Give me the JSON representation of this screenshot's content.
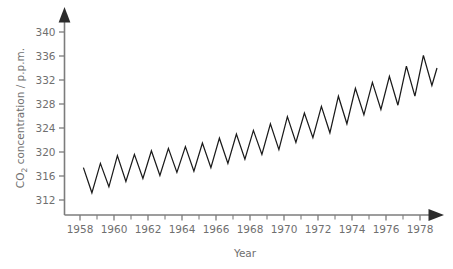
{
  "chart_data": {
    "type": "line",
    "title": "",
    "subtitle": "",
    "xlabel": "Year",
    "ylabel": "CO2 concentration / p.p.m.",
    "ylabel_parts": {
      "prefix": "CO",
      "subscript": "2",
      "suffix": " concentration / p.p.m."
    },
    "grid": false,
    "legend": "none",
    "xlim": [
      1957.6,
      1979.3
    ],
    "ylim": [
      310.0,
      341.5
    ],
    "x_ticks_major": [
      1958,
      1960,
      1962,
      1964,
      1966,
      1968,
      1970,
      1972,
      1974,
      1976,
      1978
    ],
    "x_tick_labels": [
      "1958",
      "1960",
      "1962",
      "1964",
      "1966",
      "1968",
      "1970",
      "1972",
      "1974",
      "1976",
      "1978"
    ],
    "x_ticks_minor": [
      1959,
      1961,
      1963,
      1965,
      1967,
      1969,
      1971,
      1973,
      1975,
      1977,
      1979
    ],
    "y_ticks": [
      312,
      316,
      320,
      324,
      328,
      332,
      336,
      340
    ],
    "y_tick_labels": [
      "312",
      "316",
      "320",
      "324",
      "328",
      "332",
      "336",
      "340"
    ],
    "series": [
      {
        "name": "Atmospheric CO2 (Mauna Loa monthly mean)",
        "color": "#1a1a1a",
        "x": [
          1958.2,
          1958.7,
          1959.2,
          1959.7,
          1960.2,
          1960.7,
          1961.2,
          1961.7,
          1962.2,
          1962.7,
          1963.2,
          1963.7,
          1964.2,
          1964.7,
          1965.2,
          1965.7,
          1966.2,
          1966.7,
          1967.2,
          1967.7,
          1968.2,
          1968.7,
          1969.2,
          1969.7,
          1970.2,
          1970.7,
          1971.2,
          1971.7,
          1972.2,
          1972.7,
          1973.2,
          1973.7,
          1974.2,
          1974.7,
          1975.2,
          1975.7,
          1976.2,
          1976.7,
          1977.2,
          1977.7,
          1978.2,
          1978.7,
          1979.0
        ],
        "values": [
          317.4,
          313.2,
          318.1,
          314.2,
          319.4,
          315.1,
          319.6,
          315.6,
          320.2,
          316.1,
          320.6,
          316.6,
          320.9,
          316.8,
          321.5,
          317.4,
          322.3,
          318.1,
          323.0,
          318.8,
          323.6,
          319.6,
          324.7,
          320.4,
          325.9,
          321.6,
          326.5,
          322.4,
          327.6,
          323.2,
          329.3,
          324.7,
          330.6,
          326.2,
          331.6,
          327.1,
          332.6,
          327.8,
          334.3,
          329.3,
          336.1,
          331.1,
          334.0
        ],
        "annual_peaks": [
          {
            "year": 1958,
            "value": 317.4
          },
          {
            "year": 1959,
            "value": 318.1
          },
          {
            "year": 1960,
            "value": 319.4
          },
          {
            "year": 1961,
            "value": 319.6
          },
          {
            "year": 1962,
            "value": 320.2
          },
          {
            "year": 1963,
            "value": 320.6
          },
          {
            "year": 1964,
            "value": 320.9
          },
          {
            "year": 1965,
            "value": 321.5
          },
          {
            "year": 1966,
            "value": 322.3
          },
          {
            "year": 1967,
            "value": 323.0
          },
          {
            "year": 1968,
            "value": 323.6
          },
          {
            "year": 1969,
            "value": 324.7
          },
          {
            "year": 1970,
            "value": 325.9
          },
          {
            "year": 1971,
            "value": 326.5
          },
          {
            "year": 1972,
            "value": 327.6
          },
          {
            "year": 1973,
            "value": 329.3
          },
          {
            "year": 1974,
            "value": 330.6
          },
          {
            "year": 1975,
            "value": 331.6
          },
          {
            "year": 1976,
            "value": 332.6
          },
          {
            "year": 1977,
            "value": 334.3
          },
          {
            "year": 1978,
            "value": 336.1
          }
        ],
        "annual_troughs": [
          {
            "year": 1958,
            "value": 313.2
          },
          {
            "year": 1959,
            "value": 314.2
          },
          {
            "year": 1960,
            "value": 315.1
          },
          {
            "year": 1961,
            "value": 315.6
          },
          {
            "year": 1962,
            "value": 316.1
          },
          {
            "year": 1963,
            "value": 316.6
          },
          {
            "year": 1964,
            "value": 316.8
          },
          {
            "year": 1965,
            "value": 317.4
          },
          {
            "year": 1966,
            "value": 318.1
          },
          {
            "year": 1967,
            "value": 318.8
          },
          {
            "year": 1968,
            "value": 319.6
          },
          {
            "year": 1969,
            "value": 320.4
          },
          {
            "year": 1970,
            "value": 321.6
          },
          {
            "year": 1971,
            "value": 322.4
          },
          {
            "year": 1972,
            "value": 323.2
          },
          {
            "year": 1973,
            "value": 324.7
          },
          {
            "year": 1974,
            "value": 326.2
          },
          {
            "year": 1975,
            "value": 327.1
          },
          {
            "year": 1976,
            "value": 327.8
          },
          {
            "year": 1977,
            "value": 329.3
          },
          {
            "year": 1978,
            "value": 331.1
          }
        ]
      }
    ],
    "colors": {
      "curve": "#1a1a1a",
      "axis": "#7c7c7c",
      "text": "#6f6f6f",
      "arrow": "#2c2c2c",
      "background": "#ffffff"
    }
  }
}
